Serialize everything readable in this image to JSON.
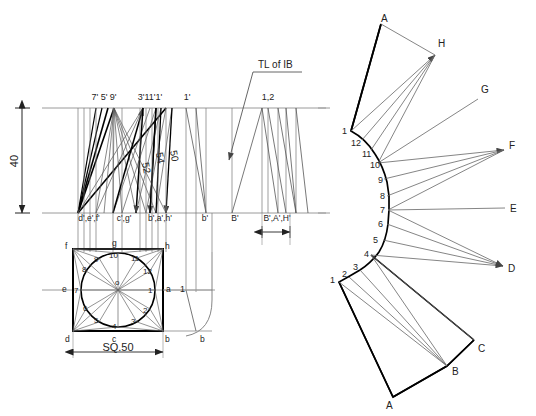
{
  "drawing": {
    "title": "Development of a square prism with cylindrical transition",
    "type": "orthographic-engineering-drawing",
    "colors": {
      "outline": "#000000",
      "construction": "#7a7a7a",
      "reference": "#9a9a9a",
      "text": "#222222",
      "background": "#ffffff"
    }
  },
  "front_view": {
    "height_dimension": "40",
    "top_point_labels": [
      {
        "text": "7' 5' 9'",
        "x": 104,
        "y": 96
      },
      {
        "text": "3'11'1'",
        "x": 146,
        "y": 96
      },
      {
        "text": "1'",
        "x": 186,
        "y": 96
      },
      {
        "text": "1,2",
        "x": 268,
        "y": 96
      }
    ],
    "bottom_point_labels": [
      {
        "text": "d',e',f'",
        "x": 89,
        "y": 219
      },
      {
        "text": "c',g'",
        "x": 123,
        "y": 219
      },
      {
        "text": "b',a',h'",
        "x": 161,
        "y": 219
      },
      {
        "text": "b'",
        "x": 204,
        "y": 219
      },
      {
        "text": "B'",
        "x": 234,
        "y": 219
      },
      {
        "text": "B',A',H'",
        "x": 272,
        "y": 219
      }
    ],
    "slant_length_labels": [
      {
        "text": "52",
        "x": 142,
        "y": 163
      },
      {
        "text": "54",
        "x": 156,
        "y": 153
      },
      {
        "text": "50",
        "x": 170,
        "y": 151
      }
    ],
    "annotation": {
      "text": "TL of  IB",
      "x": 258,
      "y": 68
    }
  },
  "top_view": {
    "square_dimension": "SQ.50",
    "corner_labels": [
      {
        "text": "f",
        "x": 67,
        "y": 248
      },
      {
        "text": "g",
        "x": 113,
        "y": 245
      },
      {
        "text": "h",
        "x": 166,
        "y": 248
      },
      {
        "text": "e",
        "x": 64,
        "y": 292
      },
      {
        "text": "a",
        "x": 168,
        "y": 292
      },
      {
        "text": "d",
        "x": 67,
        "y": 344
      },
      {
        "text": "c",
        "x": 112,
        "y": 344
      },
      {
        "text": "b",
        "x": 165,
        "y": 344
      },
      {
        "text": "b",
        "x": 202,
        "y": 344
      },
      {
        "text": "1",
        "x": 180,
        "y": 292
      },
      {
        "text": "o",
        "x": 117,
        "y": 284
      }
    ],
    "circle_divisions": [
      {
        "text": "1",
        "x": 151,
        "y": 291
      },
      {
        "text": "2",
        "x": 145,
        "y": 311
      },
      {
        "text": "3",
        "x": 133,
        "y": 323
      },
      {
        "text": "4",
        "x": 114,
        "y": 327
      },
      {
        "text": "5",
        "x": 96,
        "y": 321
      },
      {
        "text": "6",
        "x": 85,
        "y": 309
      },
      {
        "text": "7",
        "x": 78,
        "y": 290
      },
      {
        "text": "8",
        "x": 85,
        "y": 270
      },
      {
        "text": "9",
        "x": 97,
        "y": 260
      },
      {
        "text": "10",
        "x": 114,
        "y": 256
      },
      {
        "text": "11",
        "x": 135,
        "y": 259
      },
      {
        "text": "12",
        "x": 146,
        "y": 272
      }
    ]
  },
  "development": {
    "letter_labels": [
      {
        "text": "A",
        "x": 384,
        "y": 19
      },
      {
        "text": "H",
        "x": 441,
        "y": 44
      },
      {
        "text": "G",
        "x": 483,
        "y": 90
      },
      {
        "text": "F",
        "x": 511,
        "y": 146
      },
      {
        "text": "E",
        "x": 512,
        "y": 209
      },
      {
        "text": "D",
        "x": 511,
        "y": 269
      },
      {
        "text": "C",
        "x": 480,
        "y": 349
      },
      {
        "text": "B",
        "x": 444,
        "y": 371
      },
      {
        "text": "A",
        "x": 389,
        "y": 400
      }
    ],
    "number_labels": [
      {
        "text": "1",
        "x": 344,
        "y": 131
      },
      {
        "text": "12",
        "x": 357,
        "y": 142
      },
      {
        "text": "11",
        "x": 368,
        "y": 153
      },
      {
        "text": "10",
        "x": 378,
        "y": 164
      },
      {
        "text": "9",
        "x": 383,
        "y": 180
      },
      {
        "text": "8",
        "x": 385,
        "y": 196
      },
      {
        "text": "7",
        "x": 385,
        "y": 210
      },
      {
        "text": "6",
        "x": 383,
        "y": 224
      },
      {
        "text": "5",
        "x": 379,
        "y": 240
      },
      {
        "text": "4",
        "x": 371,
        "y": 255
      },
      {
        "text": "3",
        "x": 359,
        "y": 268
      },
      {
        "text": "2",
        "x": 347,
        "y": 276
      },
      {
        "text": "1",
        "x": 334,
        "y": 281
      }
    ]
  }
}
